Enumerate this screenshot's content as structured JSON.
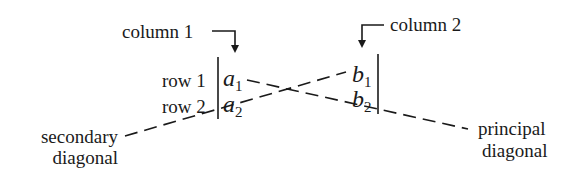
{
  "diagram": {
    "labels": {
      "column1": "column 1",
      "column2": "column 2",
      "row1": "row 1",
      "row2": "row 2",
      "secondary_line1": "secondary",
      "secondary_line2": "diagonal",
      "principal_line1": "principal",
      "principal_line2": "diagonal"
    },
    "entries": {
      "a1": {
        "base": "a",
        "sub": "1"
      },
      "a2": {
        "base": "a",
        "sub": "2"
      },
      "b1": {
        "base": "b",
        "sub": "1"
      },
      "b2": {
        "base": "b",
        "sub": "2"
      }
    },
    "icons": {
      "column1_arrow": "arrow-right-then-down",
      "column2_arrow": "arrow-left-then-down"
    },
    "colors": {
      "ink": "#1a1a1a",
      "background": "#ffffff"
    }
  }
}
